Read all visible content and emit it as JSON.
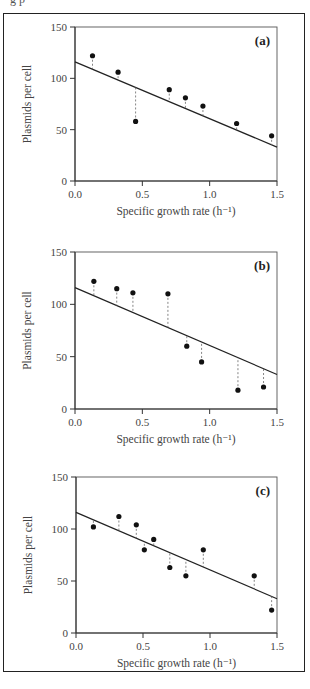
{
  "caption_fragment": "g           p",
  "chart_data": [
    {
      "type": "scatter",
      "panel_label": "(a)",
      "xlabel": "Specific growth rate (h⁻¹)",
      "ylabel": "Plasmids per cell",
      "xlim": [
        0.0,
        1.5
      ],
      "ylim": [
        0,
        150
      ],
      "xticks": [
        "0.0",
        "0.5",
        "1.0",
        "1.5"
      ],
      "yticks": [
        "0",
        "50",
        "100",
        "150"
      ],
      "grid": false,
      "points": {
        "x": [
          0.13,
          0.32,
          0.45,
          0.7,
          0.82,
          0.95,
          1.2,
          1.46
        ],
        "y": [
          122,
          106,
          58,
          89,
          81,
          73,
          56,
          44
        ]
      },
      "fit_line": {
        "x": [
          0.0,
          1.5
        ],
        "y": [
          116,
          33
        ]
      },
      "residuals": "dashed vertical lines from each point to fit line"
    },
    {
      "type": "scatter",
      "panel_label": "(b)",
      "xlabel": "Specific growth rate (h⁻¹)",
      "ylabel": "Plasmids per cell",
      "xlim": [
        0.0,
        1.5
      ],
      "ylim": [
        0,
        150
      ],
      "xticks": [
        "0.0",
        "0.5",
        "1.0",
        "1.5"
      ],
      "yticks": [
        "0",
        "50",
        "100",
        "150"
      ],
      "grid": false,
      "points": {
        "x": [
          0.14,
          0.31,
          0.43,
          0.69,
          0.83,
          0.94,
          1.21,
          1.4
        ],
        "y": [
          122,
          115,
          111,
          110,
          60,
          45,
          18,
          21
        ]
      },
      "fit_line": {
        "x": [
          0.0,
          1.5
        ],
        "y": [
          116,
          33
        ]
      },
      "residuals": "dashed vertical lines from each point to fit line"
    },
    {
      "type": "scatter",
      "panel_label": "(c)",
      "xlabel": "Specific growth rate (h⁻¹)",
      "ylabel": "Plasmids per cell",
      "xlim": [
        0.0,
        1.5
      ],
      "ylim": [
        0,
        150
      ],
      "xticks": [
        "0.0",
        "0.5",
        "1.0",
        "1.5"
      ],
      "yticks": [
        "0",
        "50",
        "100",
        "150"
      ],
      "grid": false,
      "points": {
        "x": [
          0.13,
          0.32,
          0.45,
          0.51,
          0.58,
          0.7,
          0.82,
          0.95,
          1.33,
          1.46
        ],
        "y": [
          102,
          112,
          104,
          80,
          90,
          63,
          55,
          80,
          55,
          22
        ]
      },
      "fit_line": {
        "x": [
          0.0,
          1.5
        ],
        "y": [
          116,
          33
        ]
      },
      "residuals": "dashed vertical lines from each point to fit line"
    }
  ],
  "style": {
    "axis_color": "#333333",
    "point_color": "#111111",
    "line_color": "#222222",
    "residual_color": "#666666"
  }
}
